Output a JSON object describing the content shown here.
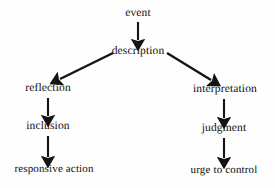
{
  "diagram": {
    "background_color": "#fefefe",
    "text_color": "#100f0e",
    "arrow_color": "#151413",
    "nodes": [
      {
        "id": "event",
        "label": "event",
        "x": 138,
        "y": 14
      },
      {
        "id": "description",
        "label": "description",
        "x": 138,
        "y": 52
      },
      {
        "id": "reflection",
        "label": "reflection",
        "x": 48,
        "y": 89
      },
      {
        "id": "interpretation",
        "label": "interpretation",
        "x": 225,
        "y": 90
      },
      {
        "id": "inclusion",
        "label": "inclusion",
        "x": 48,
        "y": 127
      },
      {
        "id": "judgment",
        "label": "judgment",
        "x": 224,
        "y": 129
      },
      {
        "id": "responsive-action",
        "label": "responsive action",
        "x": 54,
        "y": 169
      },
      {
        "id": "urge-to-control",
        "label": "urge to control",
        "x": 224,
        "y": 170
      }
    ],
    "edges": [
      {
        "id": "event-to-description",
        "from": "event",
        "to": "description",
        "kind": "vertical",
        "x1": 138,
        "y1": 22,
        "x2": 138,
        "y2": 42
      },
      {
        "id": "description-to-reflection",
        "from": "description",
        "to": "reflection",
        "kind": "diagonal",
        "x1": 113,
        "y1": 53,
        "x2": 58,
        "y2": 80
      },
      {
        "id": "description-to-interpretation",
        "from": "description",
        "to": "interpretation",
        "kind": "diagonal",
        "x1": 167,
        "y1": 53,
        "x2": 213,
        "y2": 81
      },
      {
        "id": "reflection-to-inclusion",
        "from": "reflection",
        "to": "inclusion",
        "kind": "vertical",
        "x1": 48,
        "y1": 98,
        "x2": 48,
        "y2": 118
      },
      {
        "id": "inclusion-to-responsive-action",
        "from": "inclusion",
        "to": "responsive action",
        "kind": "vertical",
        "x1": 48,
        "y1": 136,
        "x2": 48,
        "y2": 159
      },
      {
        "id": "interpretation-to-judgment",
        "from": "interpretation",
        "to": "judgment",
        "kind": "vertical",
        "x1": 224,
        "y1": 99,
        "x2": 224,
        "y2": 120
      },
      {
        "id": "judgment-to-urge-to-control",
        "from": "judgment",
        "to": "urge to control",
        "kind": "vertical",
        "x1": 224,
        "y1": 138,
        "x2": 224,
        "y2": 160
      }
    ]
  }
}
